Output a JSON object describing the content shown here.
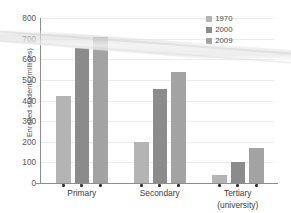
{
  "chart_data": {
    "type": "bar",
    "title": "",
    "subtitle": "",
    "xlabel": "",
    "ylabel": "Enrolled students (millions)",
    "categories": [
      "Primary",
      "Secondary",
      "Tertiary (university)"
    ],
    "category_lines": [
      [
        "Primary"
      ],
      [
        "Secondary"
      ],
      [
        "Tertiary",
        "(university)"
      ]
    ],
    "series": [
      {
        "name": "1970",
        "color": "#b4b4b4",
        "values": [
          420,
          200,
          38
        ]
      },
      {
        "name": "2000",
        "color": "#8b8b8b",
        "values": [
          655,
          455,
          100
        ]
      },
      {
        "name": "2009",
        "color": "#a3a3a3",
        "values": [
          710,
          537,
          170
        ]
      }
    ],
    "ylim": [
      0,
      800
    ],
    "yticks": [
      0,
      100,
      200,
      300,
      400,
      500,
      600,
      700,
      800
    ],
    "ytick_labels": [
      "0",
      "100",
      "200",
      "300",
      "400",
      "500",
      "600",
      "700",
      "800"
    ],
    "grid": true,
    "grid_axis": "y",
    "legend_position": "top-right"
  },
  "legend": {
    "entries": [
      {
        "label": "1970",
        "color": "#b4b4b4"
      },
      {
        "label": "2000",
        "color": "#8b8b8b"
      },
      {
        "label": "2009",
        "color": "#a3a3a3"
      }
    ]
  },
  "axes": {
    "y_title": "Enrolled students (millions)",
    "y_tick_labels": [
      "800",
      "700",
      "600",
      "500",
      "400",
      "300",
      "200",
      "100",
      "0"
    ],
    "x_labels": [
      "Primary",
      "Secondary",
      "Tertiary",
      "(university)"
    ]
  },
  "colors": {
    "series_1970": "#b4b4b4",
    "series_2000": "#8b8b8b",
    "series_2009": "#a3a3a3",
    "axis": "#8d8d8d",
    "grid": "#ececec",
    "text": "#4a4a4a",
    "background": "#ffffff"
  }
}
